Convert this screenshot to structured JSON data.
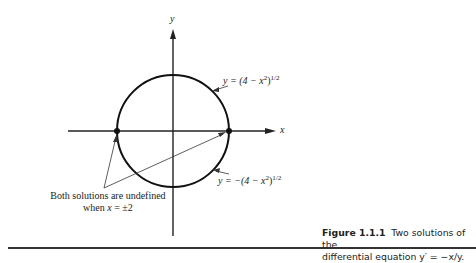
{
  "figure": {
    "axis_labels": {
      "x": "x",
      "y": "y"
    },
    "curves": [
      {
        "name": "upper",
        "label": "y = (4 − x²)¹ᐟ²",
        "label_text": "y = (4 − x",
        "label_sup": "2",
        "label_tail": ")",
        "label_exp": "1/2"
      },
      {
        "name": "lower",
        "label_text": "y = −(4 − x",
        "label_sup": "2",
        "label_tail": ")",
        "label_exp": "1/2"
      }
    ],
    "annotation": {
      "line1": "Both solutions are undefined",
      "line2_prefix": "when ",
      "line2_var": "x",
      "line2_suffix": " = ±2"
    },
    "points": [
      {
        "x": -2,
        "y": 0
      },
      {
        "x": 2,
        "y": 0
      }
    ]
  },
  "caption": {
    "number": "Figure 1.1.1",
    "text_line1": "Two solutions of the",
    "text_line2": "differential equation y′ = −x/y."
  },
  "colors": {
    "ink": "#1a1a1a",
    "background": "#ffffff"
  }
}
